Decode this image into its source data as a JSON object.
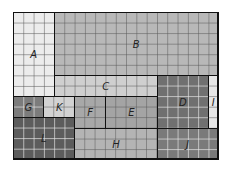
{
  "diagram": {
    "grid": {
      "columns": 20,
      "rows": 14
    },
    "rectangles": [
      {
        "label": "A",
        "col": 0,
        "row": 0,
        "w": 4,
        "h": 8,
        "fill": "#ececec"
      },
      {
        "label": "B",
        "col": 4,
        "row": 0,
        "w": 16,
        "h": 6,
        "fill": "#b8b8b8"
      },
      {
        "label": "C",
        "col": 4,
        "row": 6,
        "w": 10,
        "h": 2,
        "fill": "#cfcfcf"
      },
      {
        "label": "D",
        "col": 14,
        "row": 6,
        "w": 5,
        "h": 5,
        "fill": "#707070"
      },
      {
        "label": "I",
        "col": 19,
        "row": 6,
        "w": 1,
        "h": 5,
        "fill": "#e6e6e6"
      },
      {
        "label": "G",
        "col": 0,
        "row": 8,
        "w": 3,
        "h": 2,
        "fill": "#7c7c7c"
      },
      {
        "label": "K",
        "col": 3,
        "row": 8,
        "w": 3,
        "h": 2,
        "fill": "#d2d2d2"
      },
      {
        "label": "F",
        "col": 6,
        "row": 8,
        "w": 3,
        "h": 3,
        "fill": "#a8a8a8"
      },
      {
        "label": "E",
        "col": 9,
        "row": 8,
        "w": 5,
        "h": 3,
        "fill": "#a4a4a4"
      },
      {
        "label": "L",
        "col": 0,
        "row": 10,
        "w": 6,
        "h": 4,
        "fill": "#5c5c5c"
      },
      {
        "label": "H",
        "col": 6,
        "row": 11,
        "w": 8,
        "h": 3,
        "fill": "#b4b4b4"
      },
      {
        "label": "J",
        "col": 14,
        "row": 11,
        "w": 6,
        "h": 3,
        "fill": "#7a7a7a"
      }
    ]
  }
}
